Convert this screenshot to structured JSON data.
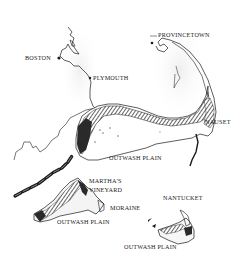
{
  "map": {
    "region": "Cape Cod and Islands",
    "colors": {
      "ink": "#1a1a1a",
      "moraine_fill": "#3a3a3a",
      "background": "#ffffff"
    },
    "labels": {
      "provincetown": "PROVINCETOWN",
      "boston": "BOSTON",
      "plymouth": "PLYMOUTH",
      "nauset": "NAUSET",
      "outwash_cape": "OUTWASH PLAIN",
      "marthas": "MARTHA'S",
      "vineyard": "VINEYARD",
      "moraine": "MORAINE",
      "nantucket": "NANTUCKET",
      "outwash_mv": "OUTWASH PLAIN",
      "outwash_nantucket": "OUTWASH PLAIN"
    }
  }
}
